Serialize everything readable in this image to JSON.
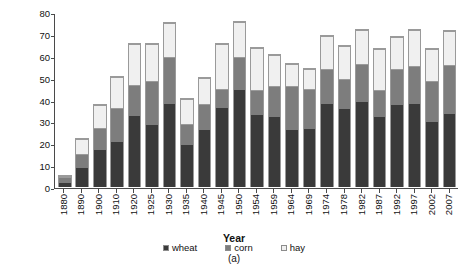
{
  "chart_data": {
    "type": "bar",
    "subtype": "stacked",
    "title": "",
    "xlabel": "Year",
    "ylabel": "Acres (millions)",
    "ylim": [
      0,
      80
    ],
    "yticks": [
      0,
      10,
      20,
      30,
      40,
      50,
      60,
      70,
      80
    ],
    "grid": false,
    "legend_position": "bottom",
    "caption": "(a)",
    "categories": [
      "1880",
      "1890",
      "1900",
      "1910",
      "1920",
      "1925",
      "1930",
      "1935",
      "1940",
      "1945",
      "1950",
      "1954",
      "1959",
      "1964",
      "1969",
      "1974",
      "1978",
      "1982",
      "1987",
      "1992",
      "1997",
      "2002",
      "2007"
    ],
    "series": [
      {
        "name": "wheat",
        "color": "#3a3a3a",
        "values": [
          2.0,
          8.5,
          17.0,
          20.5,
          32.5,
          28.5,
          38.0,
          19.0,
          26.0,
          36.0,
          44.5,
          33.0,
          32.0,
          26.0,
          26.5,
          38.0,
          35.5,
          39.0,
          32.0,
          37.5,
          38.0,
          29.5,
          33.5
        ]
      },
      {
        "name": "corn",
        "color": "#7d7d7d",
        "values": [
          2.0,
          6.0,
          9.5,
          15.0,
          13.5,
          19.5,
          21.0,
          9.5,
          11.5,
          8.5,
          14.5,
          11.0,
          13.5,
          19.5,
          18.0,
          15.5,
          13.5,
          17.0,
          12.0,
          16.0,
          17.0,
          18.5,
          22.0
        ]
      },
      {
        "name": "hay",
        "color": "#f0f0f0",
        "values": [
          0.3,
          6.5,
          10.0,
          14.0,
          18.5,
          16.5,
          15.0,
          11.0,
          11.5,
          20.0,
          15.5,
          18.5,
          14.0,
          10.0,
          8.5,
          14.5,
          14.5,
          15.0,
          18.0,
          14.0,
          16.0,
          14.0,
          15.0
        ]
      }
    ],
    "totals": [
      4.3,
      21.0,
      36.5,
      49.5,
      64.5,
      64.5,
      74.0,
      39.5,
      49.0,
      64.5,
      74.5,
      62.5,
      59.5,
      55.5,
      53.0,
      68.0,
      63.5,
      71.0,
      62.0,
      67.5,
      71.0,
      62.0,
      70.5
    ]
  }
}
